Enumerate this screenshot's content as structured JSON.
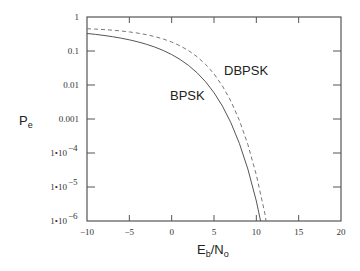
{
  "chart_data": {
    "type": "line",
    "title": "",
    "xlabel": "Eb/No",
    "xlabel_main": "E",
    "xlabel_sub1": "b",
    "xlabel_mid": "/N",
    "xlabel_sub2": "o",
    "ylabel": "Pe",
    "ylabel_main": "P",
    "ylabel_sub": "e",
    "xlim": [
      -10,
      20
    ],
    "ylim": [
      1e-06,
      1
    ],
    "yscale": "log",
    "grid": false,
    "legend": "inline labels",
    "x_ticks": [
      -10,
      -5,
      0,
      5,
      10,
      15,
      20
    ],
    "x_tick_labels": [
      "−10",
      "−5",
      "0",
      "5",
      "10",
      "15",
      "20"
    ],
    "y_ticks": [
      1,
      0.1,
      0.01,
      0.001,
      0.0001,
      1e-05,
      1e-06
    ],
    "y_tick_labels": [
      {
        "main": "1",
        "exp": ""
      },
      {
        "main": "0.1",
        "exp": ""
      },
      {
        "main": "0.01",
        "exp": ""
      },
      {
        "main": "0.001",
        "exp": ""
      },
      {
        "main": "1•10",
        "exp": "−4"
      },
      {
        "main": "1•10",
        "exp": "−5"
      },
      {
        "main": "1•10",
        "exp": "−6"
      }
    ],
    "series": [
      {
        "name": "BPSK",
        "style": "solid",
        "color": "#555555",
        "label_pos": [
          -10.0,
          0.0
        ],
        "x": [
          -10,
          -9,
          -8,
          -7,
          -6,
          -5,
          -4,
          -3,
          -2,
          -1,
          0,
          1,
          2,
          3,
          4,
          5,
          6,
          7,
          8,
          9,
          10,
          10.5
        ],
        "values": [
          0.3274,
          0.3079,
          0.2867,
          0.2638,
          0.2392,
          0.2132,
          0.1861,
          0.1584,
          0.1306,
          0.1038,
          0.0786,
          0.0563,
          0.0375,
          0.0229,
          0.0125,
          0.00595,
          0.00239,
          0.000773,
          0.000191,
          3.36e-05,
          3.87e-06,
          1e-06
        ]
      },
      {
        "name": "DBPSK",
        "style": "dashed",
        "color": "#777777",
        "x": [
          -10,
          -9,
          -8,
          -7,
          -6,
          -5,
          -4,
          -3,
          -2,
          -1,
          0,
          1,
          2,
          3,
          4,
          5,
          6,
          7,
          8,
          9,
          10,
          11,
          11.15
        ],
        "values": [
          0.4524,
          0.4408,
          0.4267,
          0.4096,
          0.3889,
          0.3644,
          0.3358,
          0.303,
          0.266,
          0.2259,
          0.1839,
          0.142,
          0.1025,
          0.068,
          0.0406,
          0.0212,
          0.00934,
          0.00333,
          0.00091,
          0.000177,
          2.27e-05,
          1.7e-06,
          1e-06
        ]
      }
    ],
    "annotations": [
      {
        "text": "BPSK",
        "series": "BPSK"
      },
      {
        "text": "DBPSK",
        "series": "DBPSK"
      }
    ]
  }
}
